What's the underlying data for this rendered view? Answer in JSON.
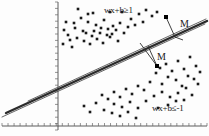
{
  "figure": {
    "type": "svm-margin-diagram",
    "background_color": "#fdfdfd",
    "ink_color": "#1a1a1a",
    "line_color": "#555555",
    "boundary_color": "#2b2b2b"
  },
  "labels": {
    "positive_constraint": "wx+b≥1",
    "negative_constraint": "wx+b≤-1",
    "margin_upper": "M",
    "margin_lower": "M"
  },
  "label_positions": {
    "positive_constraint": {
      "x": 104,
      "y": 13
    },
    "negative_constraint": {
      "x": 152,
      "y": 111
    },
    "margin_upper": {
      "x": 180,
      "y": 27
    },
    "margin_lower": {
      "x": 157,
      "y": 60
    }
  },
  "axes": {
    "x_axis": {
      "y": 126,
      "x_start": 2,
      "x_end": 207,
      "tick_count": 34,
      "tick_length": 3
    },
    "y_axis": {
      "x": 58,
      "y_start": 2,
      "y_end": 130,
      "tick_count": 20,
      "tick_length": 3
    }
  },
  "lines": {
    "decision_boundary": {
      "x1": 6,
      "y1": 113,
      "x2": 207,
      "y2": 21,
      "width": 2.4,
      "style": "solid"
    },
    "margin_upper": {
      "x1": 28,
      "y1": 101,
      "x2": 206,
      "y2": 19,
      "width": 0.9,
      "style": "solid"
    },
    "margin_lower": {
      "x1": 2,
      "y1": 117,
      "x2": 205,
      "y2": 24,
      "width": 0.9,
      "style": "solid"
    }
  },
  "margin_indicators": [
    {
      "name": "upper",
      "x1": 166,
      "y1": 17,
      "x2": 175,
      "y2": 37,
      "tick_x": 183,
      "tick_y": 40
    },
    {
      "name": "lower",
      "x1": 148,
      "y1": 46,
      "x2": 157,
      "y2": 66,
      "tick_x": 140,
      "tick_y": 43
    }
  ],
  "support_vectors": [
    {
      "x": 166,
      "y": 17,
      "size": 4
    },
    {
      "x": 157,
      "y": 66,
      "size": 4
    }
  ],
  "chart_data": {
    "type": "scatter",
    "classes": [
      {
        "name": "positive",
        "label": "wx+b≥1",
        "marker": "filled-square",
        "points": [
          [
            78,
            9
          ],
          [
            81,
            18
          ],
          [
            64,
            30
          ],
          [
            68,
            35
          ],
          [
            75,
            28
          ],
          [
            83,
            31
          ],
          [
            88,
            22
          ],
          [
            92,
            36
          ],
          [
            96,
            25
          ],
          [
            100,
            33
          ],
          [
            104,
            20
          ],
          [
            108,
            29
          ],
          [
            112,
            34
          ],
          [
            70,
            40
          ],
          [
            77,
            38
          ],
          [
            84,
            41
          ],
          [
            90,
            44
          ],
          [
            97,
            39
          ],
          [
            103,
            43
          ],
          [
            110,
            37
          ],
          [
            116,
            30
          ],
          [
            118,
            41
          ],
          [
            63,
            44
          ],
          [
            72,
            47
          ],
          [
            86,
            33
          ],
          [
            94,
            31
          ],
          [
            101,
            28
          ],
          [
            107,
            35
          ],
          [
            113,
            26
          ],
          [
            120,
            23
          ],
          [
            124,
            33
          ],
          [
            128,
            27
          ],
          [
            131,
            19
          ],
          [
            135,
            25
          ],
          [
            139,
            14
          ],
          [
            143,
            22
          ],
          [
            146,
            10
          ],
          [
            152,
            16
          ],
          [
            157,
            12
          ],
          [
            122,
            12
          ],
          [
            110,
            12
          ],
          [
            93,
            13
          ],
          [
            66,
            22
          ],
          [
            74,
            23
          ],
          [
            88,
            14
          ]
        ]
      },
      {
        "name": "negative",
        "label": "wx+b≤-1",
        "marker": "filled-square",
        "points": [
          [
            160,
            68
          ],
          [
            166,
            64
          ],
          [
            172,
            71
          ],
          [
            178,
            61
          ],
          [
            184,
            69
          ],
          [
            190,
            57
          ],
          [
            196,
            66
          ],
          [
            188,
            76
          ],
          [
            194,
            79
          ],
          [
            200,
            72
          ],
          [
            176,
            80
          ],
          [
            182,
            86
          ],
          [
            168,
            77
          ],
          [
            162,
            84
          ],
          [
            156,
            73
          ],
          [
            150,
            82
          ],
          [
            144,
            90
          ],
          [
            138,
            86
          ],
          [
            132,
            94
          ],
          [
            126,
            89
          ],
          [
            120,
            97
          ],
          [
            114,
            92
          ],
          [
            108,
            99
          ],
          [
            102,
            95
          ],
          [
            114,
            104
          ],
          [
            122,
            107
          ],
          [
            130,
            102
          ],
          [
            138,
            108
          ],
          [
            146,
            101
          ],
          [
            154,
            96
          ],
          [
            162,
            92
          ],
          [
            170,
            97
          ],
          [
            178,
            93
          ],
          [
            186,
            88
          ],
          [
            192,
            95
          ],
          [
            198,
            84
          ],
          [
            96,
            103
          ],
          [
            104,
            110
          ],
          [
            112,
            113
          ],
          [
            120,
            116
          ],
          [
            128,
            112
          ],
          [
            136,
            118
          ],
          [
            90,
            112
          ],
          [
            84,
            106
          ],
          [
            168,
            105
          ],
          [
            176,
            101
          ],
          [
            184,
            100
          ],
          [
            158,
            108
          ]
        ]
      }
    ],
    "annotations": [
      {
        "text": "wx+b≥1",
        "x": 104,
        "y": 13
      },
      {
        "text": "wx+b≤-1",
        "x": 152,
        "y": 111
      },
      {
        "text": "M",
        "x": 180,
        "y": 27
      },
      {
        "text": "M",
        "x": 157,
        "y": 60
      }
    ],
    "grid": false,
    "legend": "none"
  }
}
